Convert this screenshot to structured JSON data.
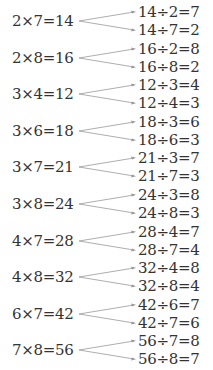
{
  "groups": [
    {
      "product": "2×7=14",
      "div1": "14÷2=7",
      "div2": "14÷7=2"
    },
    {
      "product": "2×8=16",
      "div1": "16÷2=8",
      "div2": "16÷8=2"
    },
    {
      "product": "3×4=12",
      "div1": "12÷3=4",
      "div2": "12÷4=3"
    },
    {
      "product": "3×6=18",
      "div1": "18÷3=6",
      "div2": "18÷6=3"
    },
    {
      "product": "3×7=21",
      "div1": "21÷3=7",
      "div2": "21÷7=3"
    },
    {
      "product": "3×8=24",
      "div1": "24÷3=8",
      "div2": "24÷8=3"
    },
    {
      "product": "4×7=28",
      "div1": "28÷4=7",
      "div2": "28÷7=4"
    },
    {
      "product": "4×8=32",
      "div1": "32÷4=8",
      "div2": "32÷8=4"
    },
    {
      "product": "6×7=42",
      "div1": "42÷6=7",
      "div2": "42÷7=6"
    },
    {
      "product": "7×8=56",
      "div1": "56÷7=8",
      "div2": "56÷8=7"
    }
  ],
  "colors": {
    "text": "#333333",
    "arrow": "#999999"
  }
}
